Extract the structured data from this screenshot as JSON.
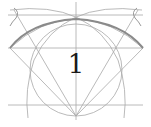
{
  "diagram": {
    "label": "1",
    "colors": {
      "background": "#ffffff",
      "construction_line": "#a8a8a8",
      "main_arc": "#8a8a8a",
      "label": "#1a1a1a"
    }
  }
}
